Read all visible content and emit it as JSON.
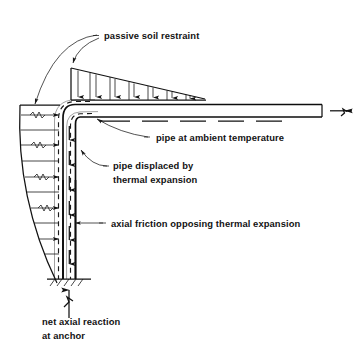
{
  "figure": {
    "background_color": "#ffffff",
    "line_color": "#121212",
    "width": 354,
    "height": 356
  },
  "labels": {
    "passive_soil_restraint": "passive soil restraint",
    "pipe_at_ambient_temperature": "pipe at ambient temperature",
    "pipe_displaced_line1": "pipe displaced by",
    "pipe_displaced_line2": "thermal expansion",
    "axial_friction": "axial friction opposing thermal expansion",
    "net_axial_reaction_line1": "net axial reaction",
    "net_axial_reaction_line2": "at anchor"
  },
  "elements": {
    "horizontal_pipe": "horizontal-pipe",
    "vertical_pipe": "vertical-pipe",
    "pipe_elbow": "pipe-elbow",
    "displaced_pipe_outline": "displaced-pipe-dashed-outline",
    "soil_pressure_wedge_top": "horizontal-soil-pressure-wedge",
    "soil_pressure_wedge_side": "vertical-soil-pressure-wedge",
    "anchor_hatching": "anchor-fixity-hatching",
    "pipe_break_symbol_right": "pipe-break-symbol",
    "anchor_reaction_arrow": "net-axial-reaction-arrow"
  }
}
